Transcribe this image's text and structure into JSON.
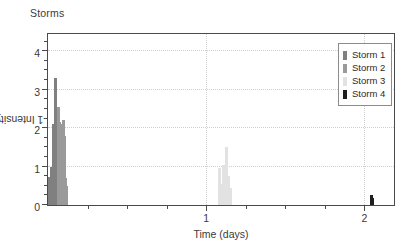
{
  "chart_data": {
    "type": "bar",
    "title": "Storms",
    "xlabel": "Time (days)",
    "ylabel_prefix": "Intensity (mm h",
    "ylabel_sup": "-1",
    "ylabel_suffix": ")",
    "ylabel_full": "Intensity (mm h-1)",
    "xlim": [
      0,
      2.2
    ],
    "ylim": [
      0,
      4.5
    ],
    "grid": true,
    "grid_x_values": [
      1,
      2
    ],
    "grid_y_values": [
      1,
      2,
      3,
      4
    ],
    "x_ticks_major": [
      1,
      2
    ],
    "x_tick_labels": [
      "1",
      "2"
    ],
    "x_ticks_minor": [
      0.25,
      0.5,
      0.75,
      1.25,
      1.5,
      1.75,
      2.0
    ],
    "y_ticks_major": [
      0,
      1,
      2,
      3,
      4
    ],
    "y_tick_labels": [
      "0",
      "1",
      "2",
      "3",
      "4"
    ],
    "y_ticks_minor": [
      0.25,
      0.5,
      0.75,
      1.25,
      1.5,
      1.75,
      2.25,
      2.5,
      2.75,
      3.25,
      3.5,
      3.75,
      4.25
    ],
    "legend_position": "top-right",
    "series": [
      {
        "name": "Storm 1",
        "color": "#808080",
        "points": [
          {
            "x": 0.005,
            "y": 0.55
          },
          {
            "x": 0.012,
            "y": 0.72
          },
          {
            "x": 0.019,
            "y": 1.0
          },
          {
            "x": 0.026,
            "y": 0.62
          },
          {
            "x": 0.033,
            "y": 2.1
          },
          {
            "x": 0.04,
            "y": 1.3
          },
          {
            "x": 0.047,
            "y": 3.3
          },
          {
            "x": 0.054,
            "y": 1.05
          },
          {
            "x": 0.061,
            "y": 0.6
          }
        ]
      },
      {
        "name": "Storm 2",
        "color": "#9a9a9a",
        "points": [
          {
            "x": 0.068,
            "y": 2.55
          },
          {
            "x": 0.075,
            "y": 2.15
          },
          {
            "x": 0.082,
            "y": 2.1
          },
          {
            "x": 0.089,
            "y": 1.55
          },
          {
            "x": 0.096,
            "y": 2.2
          },
          {
            "x": 0.103,
            "y": 1.8
          },
          {
            "x": 0.11,
            "y": 0.7
          },
          {
            "x": 0.117,
            "y": 0.5
          }
        ]
      },
      {
        "name": "Storm 3",
        "color": "#e2e2e2",
        "points": [
          {
            "x": 1.085,
            "y": 0.95
          },
          {
            "x": 1.095,
            "y": 0.55
          },
          {
            "x": 1.112,
            "y": 1.05
          },
          {
            "x": 1.126,
            "y": 1.52
          },
          {
            "x": 1.14,
            "y": 0.75
          },
          {
            "x": 1.152,
            "y": 0.45
          }
        ]
      },
      {
        "name": "Storm 4",
        "color": "#1f1f1f",
        "points": [
          {
            "x": 2.045,
            "y": 0.26
          },
          {
            "x": 2.055,
            "y": 0.18
          }
        ]
      }
    ]
  },
  "legend": {
    "items": [
      {
        "label": "Storm 1",
        "color": "#808080"
      },
      {
        "label": "Storm 2",
        "color": "#9a9a9a"
      },
      {
        "label": "Storm 3",
        "color": "#e2e2e2"
      },
      {
        "label": "Storm 4",
        "color": "#1f1f1f"
      }
    ]
  }
}
